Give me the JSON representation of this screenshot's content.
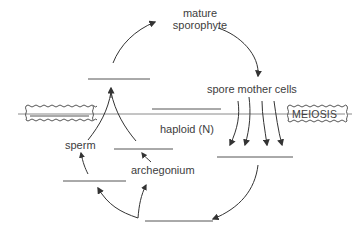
{
  "diagram": {
    "labels": {
      "mature_sporophyte_line1": "mature",
      "mature_sporophyte_line2": "sporophyte",
      "spore_mother_cells": "spore  mother  cells",
      "meiosis": "MEIOSIS",
      "haploid": "haploid (N)",
      "sperm": "sperm",
      "archegonium": "archegonium"
    },
    "blanks": [
      {
        "id": "blank-top-left",
        "label": ""
      },
      {
        "id": "blank-center",
        "label": ""
      },
      {
        "id": "blank-right-mid",
        "label": ""
      },
      {
        "id": "blank-left-lower",
        "label": ""
      },
      {
        "id": "blank-center-lower",
        "label": ""
      },
      {
        "id": "blank-bottom",
        "label": ""
      },
      {
        "id": "blank-fertilization-box",
        "label": ""
      }
    ],
    "colors": {
      "line": "#555555",
      "text": "#3d3d3d",
      "divider": "#8a8a8a"
    }
  }
}
